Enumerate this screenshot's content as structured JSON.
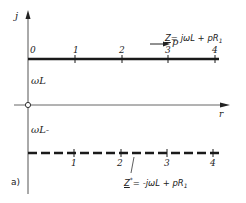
{
  "axes": {
    "vertical_label": "j",
    "horizontal_label": "r",
    "origin": "O"
  },
  "upper_line": {
    "label_omega": "ωL",
    "direction_label": "p",
    "formula_Z": "Z",
    "formula_rest": "= jωL + pR",
    "formula_sub": "1",
    "ticks": [
      "0",
      "1",
      "2",
      "3",
      "4"
    ]
  },
  "lower_line": {
    "label_omega": "ωL-",
    "formula_Z": "Z",
    "formula_star": "*",
    "formula_rest": "= -jωL + pR",
    "formula_sub": "1",
    "ticks": [
      "1",
      "2",
      "3",
      "4"
    ]
  },
  "panel_label": "a)",
  "colors": {
    "line": "#1a1a1a",
    "axis": "#555555",
    "background": "#ffffff"
  }
}
